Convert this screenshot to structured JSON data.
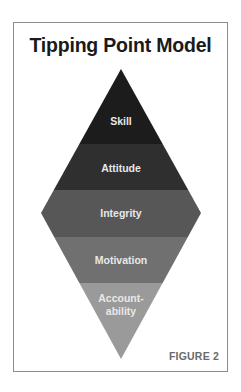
{
  "title": "Tipping Point Model",
  "figure_label": "FIGURE 2",
  "diagram": {
    "shape": "diamond",
    "apex": {
      "x": 121,
      "y": 69
    },
    "bottom": {
      "x": 121,
      "y": 359
    },
    "widest": {
      "y": 213,
      "half_width": 80
    },
    "bands": [
      {
        "label_lines": [
          "Skill"
        ],
        "color": "#1c1c1c",
        "y_from": 69,
        "y_to": 144
      },
      {
        "label_lines": [
          "Attitude"
        ],
        "color": "#2f2f2f",
        "y_from": 144,
        "y_to": 190
      },
      {
        "label_lines": [
          "Integrity"
        ],
        "color": "#575757",
        "y_from": 190,
        "y_to": 237
      },
      {
        "label_lines": [
          "Motivation"
        ],
        "color": "#707070",
        "y_from": 237,
        "y_to": 283
      },
      {
        "label_lines": [
          "Account-",
          "ability"
        ],
        "color": "#9a9a9a",
        "y_from": 283,
        "y_to": 359
      }
    ]
  },
  "labels": {
    "skill": "Skill",
    "attitude": "Attitude",
    "integrity": "Integrity",
    "motivation": "Motivation",
    "accountability_1": "Account-",
    "accountability_2": "ability"
  }
}
